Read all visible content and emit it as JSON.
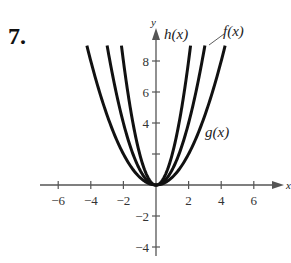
{
  "problem_number": "7.",
  "chart_data": {
    "type": "line",
    "title": "",
    "xlabel": "x",
    "ylabel": "y",
    "xlim": [
      -7.5,
      8
    ],
    "ylim": [
      -5,
      10
    ],
    "x_ticks": [
      -6,
      -4,
      -2,
      2,
      4,
      6
    ],
    "x_tick_labels": [
      "−6",
      "−4",
      "−2",
      "2",
      "4",
      "6"
    ],
    "y_ticks": [
      -4,
      -2,
      2,
      4,
      6,
      8
    ],
    "y_tick_labels": [
      "−4",
      "−2",
      "",
      "4",
      "6",
      "8"
    ],
    "grid": false,
    "series": [
      {
        "name": "h(x)",
        "formula": "2x^2",
        "coef": 2,
        "x_range": [
          -2.12,
          2.12
        ],
        "label": "h(x)"
      },
      {
        "name": "f(x)",
        "formula": "x^2",
        "coef": 1,
        "x_range": [
          -3,
          3
        ],
        "label": "f(x)"
      },
      {
        "name": "g(x)",
        "formula": "x^2/2",
        "coef": 0.5,
        "x_range": [
          -4.24,
          4.24
        ],
        "label": "g(x)"
      }
    ],
    "annotations": [
      {
        "text": "h(x)",
        "near": "top of h curve"
      },
      {
        "text": "f(x)",
        "near": "top of f curve with leader line"
      },
      {
        "text": "g(x)",
        "near": "right branch of g at y≈3.5"
      }
    ],
    "stroke_color": "#111111",
    "axis_color": "#555555"
  }
}
